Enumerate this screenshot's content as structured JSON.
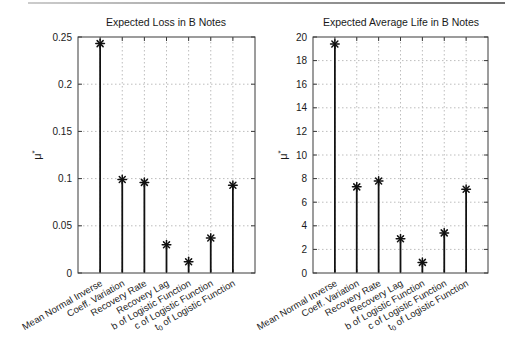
{
  "figure": {
    "left_title": "Expected Loss in B Notes",
    "right_title": "Expected Average Life in B Notes"
  },
  "chart_data": [
    {
      "type": "stem",
      "title": "Expected Loss in B Notes",
      "ylabel": "μ*",
      "ylim": [
        0,
        0.25
      ],
      "ytick_labels": [
        "0",
        "0.05",
        "0.1",
        "0.15",
        "0.2",
        "0.25"
      ],
      "grid": true,
      "legend": "none",
      "marker": "asterisk",
      "categories": [
        "Mean Normal Inverse",
        "Coeff. Variation",
        "Recovery Rate",
        "Recovery Lag",
        "b of Logistic Function",
        "c of Logistic Function",
        "t_0 of Logistic Function"
      ],
      "values": [
        0.243,
        0.099,
        0.096,
        0.03,
        0.012,
        0.037,
        0.093
      ]
    },
    {
      "type": "stem",
      "title": "Expected Average Life in B Notes",
      "ylabel": "μ*",
      "ylim": [
        0,
        20
      ],
      "ytick_labels": [
        "0",
        "2",
        "4",
        "6",
        "8",
        "10",
        "12",
        "14",
        "16",
        "18",
        "20"
      ],
      "grid": true,
      "legend": "none",
      "marker": "asterisk",
      "categories": [
        "Mean Normal Inverse",
        "Coeff. Variation",
        "Recovery Rate",
        "Recovery Lag",
        "b of Logistic Function",
        "c of Logistic Function",
        "t_0 of Logistic Function"
      ],
      "values": [
        19.4,
        7.3,
        7.8,
        2.9,
        0.9,
        3.4,
        7.1
      ]
    }
  ],
  "colors": {
    "stem": "#111111",
    "axis_box": "#3a3a3a",
    "grid": "#bdbdbd",
    "text": "#1a1a1a",
    "top_rule_left": "#cccccc",
    "top_rule_right": "#6f6f6f",
    "background": "#ffffff"
  }
}
